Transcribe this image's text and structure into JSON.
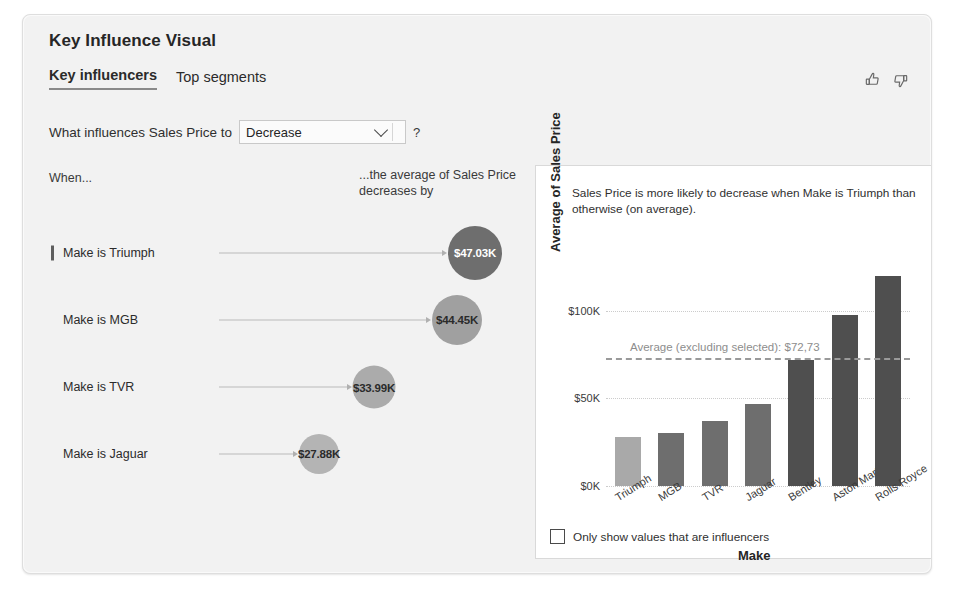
{
  "card": {
    "title": "Key Influence Visual",
    "tabs": [
      {
        "label": "Key influencers",
        "active": true
      },
      {
        "label": "Top segments",
        "active": false
      }
    ],
    "feedback": {
      "thumbs_up": "thumbs-up-icon",
      "thumbs_down": "thumbs-down-icon"
    }
  },
  "question": {
    "label": "What influences Sales Price to",
    "select_value": "Decrease",
    "select_options": [
      "Decrease",
      "Increase"
    ],
    "help": "?"
  },
  "left_pane": {
    "when_label": "When...",
    "average_caption": "...the average of Sales Price decreases by",
    "influencers": [
      {
        "label": "Make is Triumph",
        "value": "$47.03K",
        "selected": true,
        "bubble_color": "#6e6e6e",
        "text_color": "#ffffff",
        "size": 54
      },
      {
        "label": "Make is MGB",
        "value": "$44.45K",
        "selected": false,
        "bubble_color": "#a0a0a0",
        "text_color": "#2b2b2b",
        "size": 50
      },
      {
        "label": "Make is TVR",
        "value": "$33.99K",
        "selected": false,
        "bubble_color": "#ababab",
        "text_color": "#2b2b2b",
        "size": 43
      },
      {
        "label": "Make is Jaguar",
        "value": "$27.88K",
        "selected": false,
        "bubble_color": "#b4b4b4",
        "text_color": "#2b2b2b",
        "size": 40
      }
    ]
  },
  "detail": {
    "back_icon": "back-arrow-icon",
    "description": "Sales Price is more likely to decrease when Make is Triumph than otherwise (on average).",
    "checkbox": {
      "label": "Only show values that are influencers",
      "checked": false
    }
  },
  "chart_data": {
    "type": "bar",
    "title": "",
    "xlabel": "Make",
    "ylabel": "Average of Sales Price",
    "categories": [
      "Triumph",
      "MGB",
      "TVR",
      "Jaguar",
      "Bentley",
      "Aston Martin",
      "Rolls Royce"
    ],
    "values": [
      27.88,
      30.5,
      37.0,
      47.0,
      72.0,
      97.5,
      120.0
    ],
    "value_unit": "$K",
    "ylim": [
      0,
      130
    ],
    "yticks": [
      0,
      50,
      100
    ],
    "ytick_labels": [
      "$0K",
      "$50K",
      "$100K"
    ],
    "grid": true,
    "legend": "none",
    "bar_colors": [
      "#a9a9a9",
      "#6e6e6e",
      "#6e6e6e",
      "#6e6e6e",
      "#4f4f4f",
      "#4f4f4f",
      "#4f4f4f"
    ],
    "annotations": [
      {
        "type": "average-line",
        "label": "Average (excluding selected): $72,73",
        "value": 72.73,
        "style": "dashed",
        "color": "#9a9a9a"
      }
    ]
  }
}
